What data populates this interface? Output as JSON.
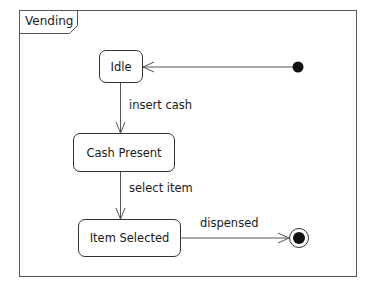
{
  "diagram": {
    "type": "uml-state-machine",
    "frame": {
      "title": "Vending"
    },
    "states": [
      {
        "id": "idle",
        "label": "Idle"
      },
      {
        "id": "cash-present",
        "label": "Cash Present"
      },
      {
        "id": "item-selected",
        "label": "Item Selected"
      }
    ],
    "pseudostates": [
      {
        "id": "initial",
        "kind": "initial"
      },
      {
        "id": "final",
        "kind": "final"
      }
    ],
    "transitions": [
      {
        "from": "initial",
        "to": "idle",
        "label": ""
      },
      {
        "from": "idle",
        "to": "cash-present",
        "label": "insert cash"
      },
      {
        "from": "cash-present",
        "to": "item-selected",
        "label": "select item"
      },
      {
        "from": "item-selected",
        "to": "final",
        "label": "dispensed"
      }
    ]
  }
}
